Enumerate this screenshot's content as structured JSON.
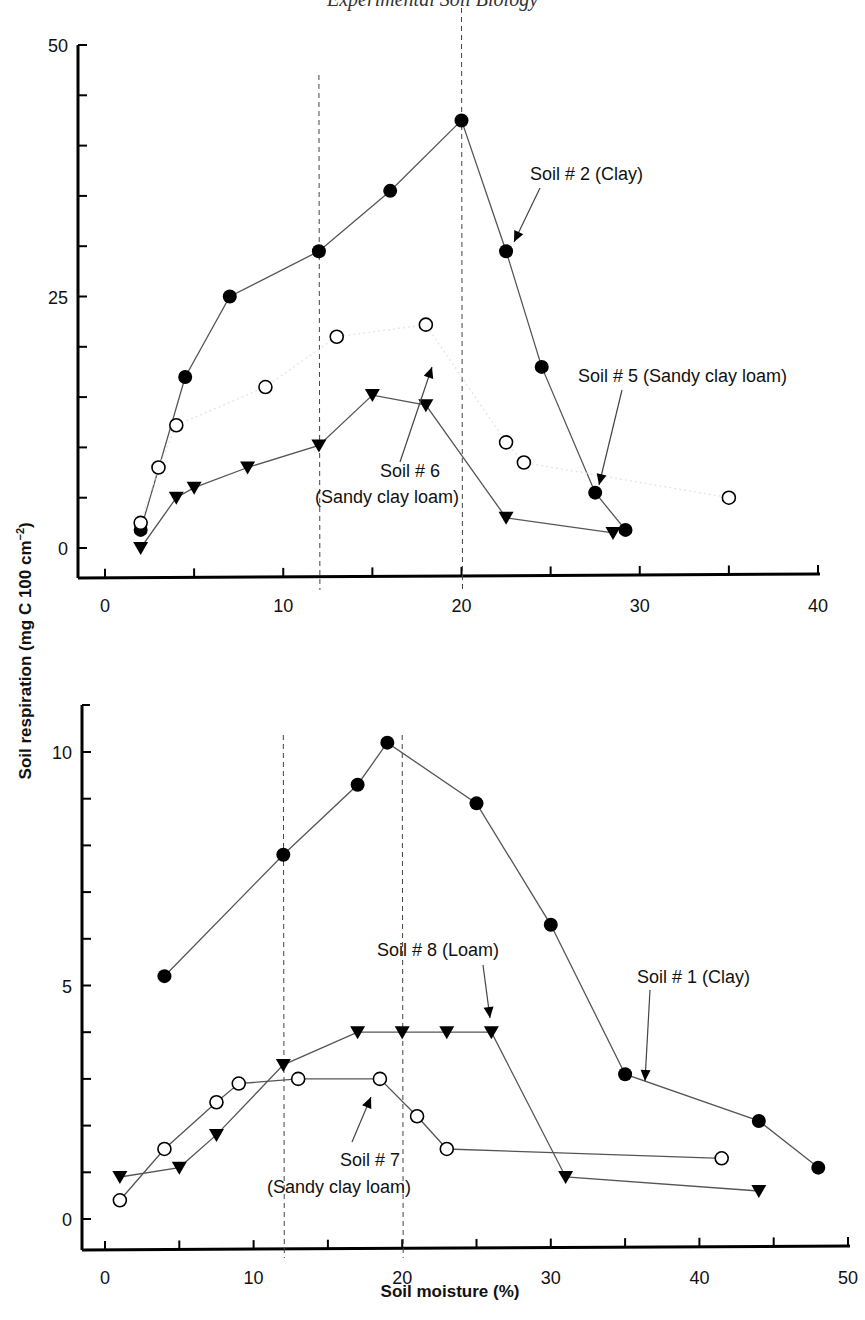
{
  "page": {
    "running_header": "Experimental Soil Biology"
  },
  "chart_data": [
    {
      "type": "line",
      "panel": "top",
      "title": "",
      "xlabel": "Soil moisture (%)",
      "ylabel": "Soil respiration (mg C 100 cm^-2)",
      "xlim": [
        0,
        40
      ],
      "ylim": [
        0,
        50
      ],
      "x_ticks": [
        0,
        10,
        20,
        30,
        40
      ],
      "x_minor_ticks": [
        5,
        15,
        25,
        35
      ],
      "y_ticks": [
        0,
        25,
        50
      ],
      "y_minor_ticks": [
        5,
        10,
        15,
        20,
        30,
        35,
        40,
        45
      ],
      "grid": false,
      "reference_lines_x": [
        12,
        20
      ],
      "series": [
        {
          "name": "Soil # 2 (Clay)",
          "marker": "filled-circle",
          "line": "solid",
          "x": [
            2,
            4.5,
            7,
            12,
            16,
            20,
            22.5,
            24.5,
            27.5,
            29.2
          ],
          "y": [
            1.8,
            17,
            25,
            29.5,
            35.5,
            42.5,
            29.5,
            18,
            5.5,
            1.8
          ]
        },
        {
          "name": "Soil # 5 (Sandy clay loam)",
          "marker": "open-circle",
          "line": "faint-dotted",
          "x": [
            2,
            3,
            4,
            9,
            13,
            18,
            22.5,
            23.5,
            35
          ],
          "y": [
            2.5,
            8,
            12.2,
            16,
            21,
            22.2,
            10.5,
            8.5,
            5
          ]
        },
        {
          "name": "Soil # 6 (Sandy clay loam)",
          "marker": "filled-triangle-down",
          "line": "solid",
          "x": [
            2,
            4,
            5,
            8,
            12,
            15,
            18,
            22.5,
            28.5
          ],
          "y": [
            0,
            5,
            6,
            8,
            10.2,
            15.2,
            14.2,
            3,
            1.5
          ]
        }
      ],
      "annotations": [
        {
          "text": "Soil # 2 (Clay)",
          "points_to": [
            22.5,
            29.5
          ]
        },
        {
          "text": "Soil # 5 (Sandy clay loam)",
          "points_to": [
            27.5,
            5.5
          ]
        },
        {
          "text": "Soil # 6",
          "text2": "(Sandy clay loam)",
          "points_to": [
            18.5,
            13
          ]
        }
      ]
    },
    {
      "type": "line",
      "panel": "bottom",
      "title": "",
      "xlabel": "Soil moisture (%)",
      "ylabel": "Soil respiration (mg C 100 cm^-2)",
      "xlim": [
        0,
        50
      ],
      "ylim": [
        0,
        10
      ],
      "x_ticks": [
        0,
        10,
        20,
        30,
        40,
        50
      ],
      "x_minor_ticks": [
        5,
        15,
        25,
        35,
        45
      ],
      "y_ticks": [
        0,
        5,
        10
      ],
      "y_minor_ticks": [
        1,
        2,
        3,
        4,
        6,
        7,
        8,
        9
      ],
      "grid": false,
      "reference_lines_x": [
        12,
        20
      ],
      "series": [
        {
          "name": "Soil # 1 (Clay)",
          "marker": "filled-circle",
          "line": "solid",
          "x": [
            4,
            12,
            17,
            19,
            25,
            30,
            35,
            44,
            48
          ],
          "y": [
            5.2,
            7.8,
            9.3,
            10.2,
            8.9,
            6.3,
            3.1,
            2.1,
            1.1
          ]
        },
        {
          "name": "Soil # 8 (Loam)",
          "marker": "filled-triangle-down",
          "line": "solid",
          "x": [
            1,
            5,
            7.5,
            12,
            17,
            20,
            23,
            26,
            31,
            44
          ],
          "y": [
            0.9,
            1.1,
            1.8,
            3.3,
            4,
            4,
            4,
            4,
            0.9,
            0.6
          ]
        },
        {
          "name": "Soil # 7 (Sandy clay loam)",
          "marker": "open-circle",
          "line": "solid",
          "x": [
            1,
            4,
            7.5,
            9,
            13,
            18.5,
            21,
            23,
            41.5
          ],
          "y": [
            0.4,
            1.5,
            2.5,
            2.9,
            3,
            3,
            2.2,
            1.5,
            1.3
          ]
        }
      ],
      "annotations": [
        {
          "text": "Soil # 8 (Loam)",
          "points_to": [
            26,
            4.3
          ]
        },
        {
          "text": "Soil # 1 (Clay)",
          "points_to": [
            36.5,
            3
          ]
        },
        {
          "text": "Soil # 7",
          "text2": "(Sandy clay loam)",
          "points_to": [
            18.5,
            2.8
          ]
        }
      ]
    }
  ],
  "labels": {
    "ylabel": "Soil respiration (mg C 100 cm",
    "ylabel_sup": "−2",
    "ylabel_close": ")",
    "xlabel": "Soil moisture (%)"
  }
}
